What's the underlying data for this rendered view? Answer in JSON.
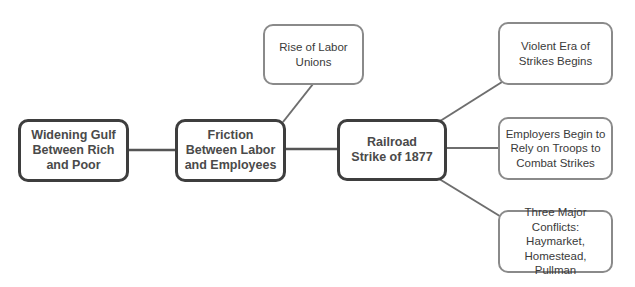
{
  "diagram": {
    "type": "concept-map",
    "colors": {
      "primary_border": "#3e3e3e",
      "secondary_border": "#8a8a8a",
      "connector": "#6e6e6e",
      "text": "#333333",
      "background": "#ffffff"
    },
    "nodes": [
      {
        "id": "gulf",
        "label": "Widening Gulf Between Rich and Poor",
        "style": "primary"
      },
      {
        "id": "friction",
        "label": "Friction Between Labor and Employees",
        "style": "primary"
      },
      {
        "id": "railroad",
        "label": "Railroad Strike of 1877",
        "style": "primary"
      },
      {
        "id": "unions",
        "label": "Rise of Labor Unions",
        "style": "secondary"
      },
      {
        "id": "violent",
        "label": "Violent Era of Strikes Begins",
        "style": "secondary"
      },
      {
        "id": "troops",
        "label": "Employers Begin to Rely on Troops to Combat Strikes",
        "style": "secondary"
      },
      {
        "id": "conflicts",
        "label": "Three Major Conflicts: Haymarket, Homestead, Pullman",
        "style": "secondary"
      }
    ],
    "edges": [
      {
        "from": "gulf",
        "to": "friction"
      },
      {
        "from": "friction",
        "to": "unions"
      },
      {
        "from": "friction",
        "to": "railroad"
      },
      {
        "from": "railroad",
        "to": "violent"
      },
      {
        "from": "railroad",
        "to": "troops"
      },
      {
        "from": "railroad",
        "to": "conflicts"
      }
    ]
  }
}
